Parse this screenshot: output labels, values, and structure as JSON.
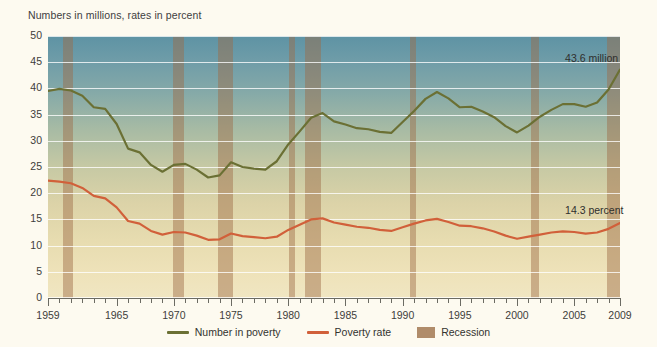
{
  "chart_data": {
    "type": "line",
    "title": "Numbers in millions, rates in percent",
    "xlabel": "",
    "ylabel": "",
    "ylim": [
      0,
      50
    ],
    "ytick_step": 5,
    "yticks": [
      "0",
      "5",
      "10",
      "15",
      "20",
      "25",
      "30",
      "35",
      "40",
      "45",
      "50"
    ],
    "xlim": [
      1959,
      2009
    ],
    "xticks_major": [
      "1959",
      "1965",
      "1970",
      "1975",
      "1980",
      "1985",
      "1990",
      "1995",
      "2000",
      "2005",
      "2009"
    ],
    "xtick_minor_step": 1,
    "grid": "horizontal",
    "legend_position": "bottom",
    "x": [
      1959,
      1960,
      1961,
      1962,
      1963,
      1964,
      1965,
      1966,
      1967,
      1968,
      1969,
      1970,
      1971,
      1972,
      1973,
      1974,
      1975,
      1976,
      1977,
      1978,
      1979,
      1980,
      1981,
      1982,
      1983,
      1984,
      1985,
      1986,
      1987,
      1988,
      1989,
      1990,
      1991,
      1992,
      1993,
      1994,
      1995,
      1996,
      1997,
      1998,
      1999,
      2000,
      2001,
      2002,
      2003,
      2004,
      2005,
      2006,
      2007,
      2008,
      2009
    ],
    "series": [
      {
        "name": "Number in poverty",
        "units": "millions",
        "color": "#6b7034",
        "values": [
          39.5,
          39.9,
          39.6,
          38.6,
          36.4,
          36.1,
          33.2,
          28.5,
          27.8,
          25.4,
          24.1,
          25.4,
          25.6,
          24.5,
          23.0,
          23.4,
          25.9,
          25.0,
          24.7,
          24.5,
          26.1,
          29.3,
          31.8,
          34.4,
          35.3,
          33.7,
          33.1,
          32.4,
          32.2,
          31.7,
          31.5,
          33.6,
          35.7,
          38.0,
          39.3,
          38.1,
          36.4,
          36.5,
          35.6,
          34.5,
          32.8,
          31.6,
          32.9,
          34.6,
          35.9,
          37.0,
          37.0,
          36.5,
          37.3,
          39.8,
          43.6
        ],
        "endpoint_label": "43.6 million"
      },
      {
        "name": "Poverty rate",
        "units": "percent",
        "color": "#d1603a",
        "values": [
          22.4,
          22.2,
          21.9,
          21.0,
          19.5,
          19.0,
          17.3,
          14.7,
          14.2,
          12.8,
          12.1,
          12.6,
          12.5,
          11.9,
          11.1,
          11.2,
          12.3,
          11.8,
          11.6,
          11.4,
          11.7,
          13.0,
          14.0,
          15.0,
          15.2,
          14.4,
          14.0,
          13.6,
          13.4,
          13.0,
          12.8,
          13.5,
          14.2,
          14.8,
          15.1,
          14.5,
          13.8,
          13.7,
          13.3,
          12.7,
          11.9,
          11.3,
          11.7,
          12.1,
          12.5,
          12.7,
          12.6,
          12.3,
          12.5,
          13.2,
          14.3
        ],
        "endpoint_label": "14.3 percent"
      }
    ],
    "recessions": [
      {
        "label": "Recession",
        "start": 1960.3,
        "end": 1961.2
      },
      {
        "label": "Recession",
        "start": 1969.9,
        "end": 1970.9
      },
      {
        "label": "Recession",
        "start": 1973.9,
        "end": 1975.2
      },
      {
        "label": "Recession",
        "start": 1980.1,
        "end": 1980.6
      },
      {
        "label": "Recession",
        "start": 1981.5,
        "end": 1982.9
      },
      {
        "label": "Recession",
        "start": 1990.6,
        "end": 1991.2
      },
      {
        "label": "Recession",
        "start": 2001.2,
        "end": 2001.9
      },
      {
        "label": "Recession",
        "start": 2007.9,
        "end": 2009.5
      }
    ],
    "annotations": [
      {
        "text": "43.6 million",
        "x": 2004.2,
        "y": 45.6
      },
      {
        "text": "14.3 percent",
        "x": 2004.2,
        "y": 16.6
      }
    ],
    "legend": [
      {
        "label": "Number in poverty",
        "marker": "line",
        "color": "#6b7034"
      },
      {
        "label": "Poverty rate",
        "marker": "line",
        "color": "#d1603a"
      },
      {
        "label": "Recession",
        "marker": "box",
        "color": "#b08c6a"
      }
    ]
  }
}
